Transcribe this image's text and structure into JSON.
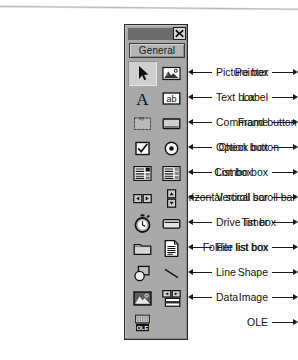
{
  "figure": {
    "kind": "visual-basic-toolbox-diagram",
    "window_title": "",
    "close_button_icon": "close-icon",
    "tab_label": "General"
  },
  "toolbox": {
    "rows": [
      {
        "left": {
          "label": "Pointer",
          "icon": "pointer-icon",
          "selected": true
        },
        "right": {
          "label": "Picture box",
          "icon": "picture-box-icon",
          "selected": false
        }
      },
      {
        "left": {
          "label": "Label",
          "icon": "label-icon",
          "selected": false
        },
        "right": {
          "label": "Text box",
          "icon": "text-box-icon",
          "selected": false
        }
      },
      {
        "left": {
          "label": "Frame",
          "icon": "frame-icon",
          "selected": false
        },
        "right": {
          "label": "Command button",
          "icon": "command-button-icon",
          "selected": false
        }
      },
      {
        "left": {
          "label": "Check box",
          "icon": "check-box-icon",
          "selected": false
        },
        "right": {
          "label": "Option button",
          "icon": "option-button-icon",
          "selected": false
        }
      },
      {
        "left": {
          "label": "Combo box",
          "icon": "combo-box-icon",
          "selected": false
        },
        "right": {
          "label": "List box",
          "icon": "list-box-icon",
          "selected": false
        }
      },
      {
        "left": {
          "label": "Horizontal scroll bar",
          "icon": "horizontal-scroll-bar-icon",
          "selected": false
        },
        "right": {
          "label": "Vertical scroll bar",
          "icon": "vertical-scroll-bar-icon",
          "selected": false
        }
      },
      {
        "left": {
          "label": "Timer",
          "icon": "timer-icon",
          "selected": false
        },
        "right": {
          "label": "Drive list box",
          "icon": "drive-list-box-icon",
          "selected": false
        }
      },
      {
        "left": {
          "label": "Folder list box",
          "icon": "folder-list-box-icon",
          "selected": false
        },
        "right": {
          "label": "File list box",
          "icon": "file-list-box-icon",
          "selected": false
        }
      },
      {
        "left": {
          "label": "Shape",
          "icon": "shape-icon",
          "selected": false
        },
        "right": {
          "label": "Line",
          "icon": "line-icon",
          "selected": false
        }
      },
      {
        "left": {
          "label": "Image",
          "icon": "image-icon",
          "selected": false
        },
        "right": {
          "label": "Data",
          "icon": "data-icon",
          "selected": false
        }
      },
      {
        "left": {
          "label": "OLE",
          "icon": "ole-icon",
          "selected": false
        },
        "right": {
          "label": "",
          "icon": "",
          "selected": false
        }
      }
    ],
    "ole_glyph_text": "OLE",
    "text_box_glyph_text": "ab",
    "label_glyph_text": "A"
  },
  "colors": {
    "toolbox_face": "#a9a9a9",
    "titlebar": "#6b6b6b",
    "tab_face": "#b4b4b4",
    "selected_cell": "#cfcfcf",
    "outline": "#1a1a1a",
    "text": "#121212"
  }
}
